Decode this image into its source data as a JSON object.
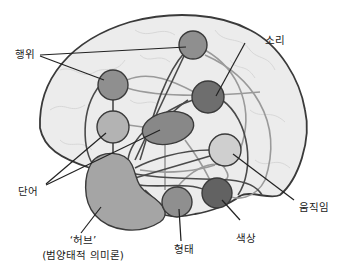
{
  "diagram": {
    "colors": {
      "brain_fill": "#ececec",
      "brain_outline": "#3a3a3a",
      "gyri_line": "#d0d0d0",
      "connection_dark": "#4a4a4a",
      "connection_light": "#9a9a9a",
      "leader_line": "#222222",
      "hub_fill": "#a5a5a5"
    },
    "nodes": [
      {
        "id": "action-top",
        "cx": 193,
        "cy": 45,
        "r": 14,
        "fill": "#8f8f8f"
      },
      {
        "id": "action-mid",
        "cx": 113,
        "cy": 85,
        "r": 15,
        "fill": "#8f8f8f"
      },
      {
        "id": "word",
        "cx": 113,
        "cy": 127,
        "r": 16,
        "fill": "#b3b3b3"
      },
      {
        "id": "sound",
        "cx": 208,
        "cy": 97,
        "r": 16,
        "fill": "#6e6e6e"
      },
      {
        "id": "temporal-oval",
        "cx": 168,
        "cy": 128,
        "rx": 26,
        "ry": 16,
        "fill": "#888888"
      },
      {
        "id": "motion",
        "cx": 225,
        "cy": 150,
        "r": 16,
        "fill": "#cfcfcf"
      },
      {
        "id": "shape",
        "cx": 177,
        "cy": 202,
        "r": 15,
        "fill": "#8f8f8f"
      },
      {
        "id": "color",
        "cx": 217,
        "cy": 193,
        "r": 15,
        "fill": "#626262"
      }
    ],
    "labels": {
      "action": "행위",
      "sound": "소리",
      "word": "단어",
      "motion": "움직임",
      "color": "색상",
      "shape": "형태",
      "hub_line1": "‘허브’",
      "hub_line2": "(범양태적 의미론)"
    }
  }
}
